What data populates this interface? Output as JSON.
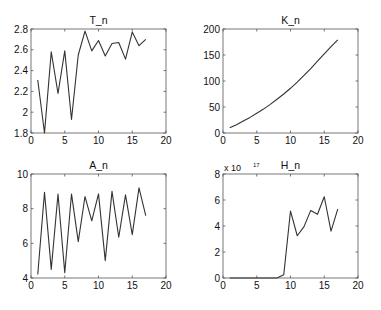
{
  "chart_data": [
    {
      "type": "line",
      "title": "T_n",
      "xlabel": "",
      "ylabel": "",
      "xlim": [
        0,
        20
      ],
      "ylim": [
        1.8,
        2.8
      ],
      "xticks": [
        0,
        5,
        10,
        15,
        20
      ],
      "yticks": [
        1.8,
        2,
        2.2,
        2.4,
        2.6,
        2.8
      ],
      "ytick_labels": [
        "1.8",
        "2",
        "2.2",
        "2.4",
        "2.6",
        "2.8"
      ],
      "x": [
        1,
        2,
        3,
        4,
        5,
        6,
        7,
        8,
        9,
        10,
        11,
        12,
        13,
        14,
        15,
        16,
        17
      ],
      "values": [
        2.31,
        1.8,
        2.58,
        2.18,
        2.59,
        1.93,
        2.55,
        2.78,
        2.59,
        2.69,
        2.54,
        2.66,
        2.67,
        2.51,
        2.77,
        2.64,
        2.7
      ],
      "grid": false,
      "exponent_label": ""
    },
    {
      "type": "line",
      "title": "K_n",
      "xlabel": "",
      "ylabel": "",
      "xlim": [
        0,
        20
      ],
      "ylim": [
        0,
        200
      ],
      "xticks": [
        0,
        5,
        10,
        15,
        20
      ],
      "yticks": [
        0,
        50,
        100,
        150,
        200
      ],
      "ytick_labels": [
        "0",
        "50",
        "100",
        "150",
        "200"
      ],
      "x": [
        1,
        2,
        3,
        4,
        5,
        6,
        7,
        8,
        9,
        10,
        11,
        12,
        13,
        14,
        15,
        16,
        17
      ],
      "values": [
        10,
        16,
        23,
        30,
        38,
        46,
        55,
        65,
        75,
        86,
        98,
        111,
        124,
        138,
        152,
        166,
        179
      ],
      "grid": false,
      "exponent_label": ""
    },
    {
      "type": "line",
      "title": "A_n",
      "xlabel": "",
      "ylabel": "",
      "xlim": [
        0,
        20
      ],
      "ylim": [
        4,
        10
      ],
      "xticks": [
        0,
        5,
        10,
        15,
        20
      ],
      "yticks": [
        4,
        6,
        8,
        10
      ],
      "ytick_labels": [
        "4",
        "6",
        "8",
        "10"
      ],
      "x": [
        1,
        2,
        3,
        4,
        5,
        6,
        7,
        8,
        9,
        10,
        11,
        12,
        13,
        14,
        15,
        16,
        17
      ],
      "values": [
        4.2,
        8.95,
        4.5,
        8.85,
        4.3,
        8.85,
        6.1,
        8.7,
        7.3,
        8.85,
        5.0,
        9.0,
        6.35,
        8.8,
        6.5,
        9.2,
        7.6
      ],
      "grid": false,
      "exponent_label": ""
    },
    {
      "type": "line",
      "title": "H_n",
      "xlabel": "",
      "ylabel": "",
      "xlim": [
        0,
        20
      ],
      "ylim": [
        0,
        8
      ],
      "xticks": [
        0,
        5,
        10,
        15,
        20
      ],
      "yticks": [
        0,
        2,
        4,
        6,
        8
      ],
      "ytick_labels": [
        "0",
        "2",
        "4",
        "6",
        "8"
      ],
      "x": [
        1,
        2,
        3,
        4,
        5,
        6,
        7,
        8,
        9,
        10,
        11,
        12,
        13,
        14,
        15,
        16,
        17
      ],
      "values": [
        0,
        0,
        0,
        0,
        0,
        0,
        0,
        0.0,
        0.25,
        5.15,
        3.25,
        3.95,
        5.2,
        4.9,
        6.25,
        3.6,
        5.3
      ],
      "value_scale": "x 10^17",
      "grid": false,
      "exponent_label": "x 10",
      "exponent_power": "17"
    }
  ],
  "layout": {
    "panels": [
      {
        "left": 31,
        "top": 29,
        "width": 135,
        "height": 104
      },
      {
        "left": 223,
        "top": 29,
        "width": 135,
        "height": 104
      },
      {
        "left": 31,
        "top": 174,
        "width": 135,
        "height": 104
      },
      {
        "left": 223,
        "top": 174,
        "width": 135,
        "height": 104
      }
    ],
    "line_color": "#333333",
    "frame_color": "#555555"
  }
}
